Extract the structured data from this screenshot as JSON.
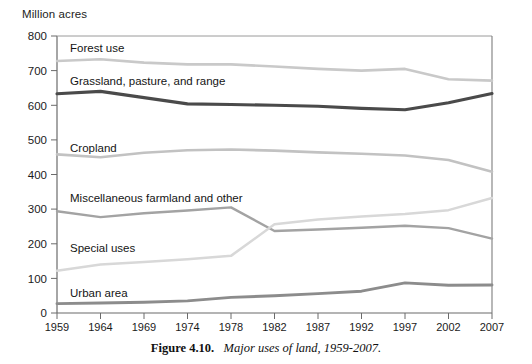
{
  "axis_unit": "Million acres",
  "caption": {
    "number": "Figure 4.10.",
    "title": "Major uses of land, 1959-2007."
  },
  "series_labels": {
    "forest": "Forest use",
    "grassland": "Grassland, pasture, and range",
    "cropland": "Cropland",
    "misc": "Miscellaneous farmland and other",
    "special": "Special uses",
    "urban": "Urban area"
  },
  "colors": {
    "forest": "#c9c9c9",
    "grassland": "#4a4a4a",
    "cropland": "#c2c2c2",
    "misc": "#a3a3a3",
    "special": "#d8d8d8",
    "urban": "#8c8c8c",
    "axis": "#6b6b6b",
    "text": "#1a1a1a"
  },
  "chart_data": {
    "type": "line",
    "title": "Major uses of land, 1959-2007",
    "xlabel": "",
    "ylabel": "Million acres",
    "ylim": [
      0,
      800
    ],
    "yticks": [
      0,
      100,
      200,
      300,
      400,
      500,
      600,
      700,
      800
    ],
    "grid": false,
    "legend_position": "inline-labels",
    "categories": [
      "1959",
      "1964",
      "1969",
      "1974",
      "1978",
      "1982",
      "1987",
      "1992",
      "1997",
      "2002",
      "2007"
    ],
    "series": [
      {
        "name": "Forest use",
        "values": [
          728,
          733,
          723,
          718,
          718,
          712,
          705,
          700,
          705,
          675,
          671
        ]
      },
      {
        "name": "Grassland, pasture, and range",
        "values": [
          633,
          640,
          622,
          604,
          602,
          600,
          597,
          591,
          587,
          607,
          634
        ]
      },
      {
        "name": "Cropland",
        "values": [
          458,
          450,
          463,
          470,
          472,
          469,
          464,
          460,
          455,
          442,
          408
        ]
      },
      {
        "name": "Miscellaneous farmland and other",
        "values": [
          294,
          277,
          288,
          296,
          305,
          237,
          241,
          246,
          252,
          245,
          215
        ]
      },
      {
        "name": "Special uses",
        "values": [
          122,
          140,
          147,
          155,
          165,
          256,
          270,
          279,
          286,
          297,
          332
        ]
      },
      {
        "name": "Urban area",
        "values": [
          27,
          29,
          31,
          35,
          45,
          50,
          56,
          63,
          87,
          80,
          81
        ]
      }
    ]
  }
}
